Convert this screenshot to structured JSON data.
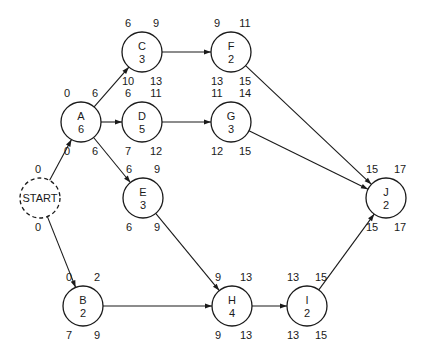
{
  "diagram": {
    "type": "PERT / activity-on-node network",
    "nodes": [
      {
        "id": "START",
        "name": "START",
        "duration": "",
        "x": 40,
        "y": 198,
        "dashed": true,
        "es": "0",
        "ef": "",
        "ls": "0",
        "lf": ""
      },
      {
        "id": "A",
        "name": "A",
        "duration": "6",
        "x": 81,
        "y": 122,
        "es": "0",
        "ef": "6",
        "ls": "0",
        "lf": "6"
      },
      {
        "id": "B",
        "name": "B",
        "duration": "2",
        "x": 83,
        "y": 306,
        "es": "0",
        "ef": "2",
        "ls": "7",
        "lf": "9"
      },
      {
        "id": "C",
        "name": "C",
        "duration": "3",
        "x": 142,
        "y": 52,
        "es": "6",
        "ef": "9",
        "ls": "10",
        "lf": "13"
      },
      {
        "id": "D",
        "name": "D",
        "duration": "5",
        "x": 142,
        "y": 122,
        "es": "6",
        "ef": "11",
        "ls": "7",
        "lf": "12"
      },
      {
        "id": "E",
        "name": "E",
        "duration": "3",
        "x": 143,
        "y": 198,
        "es": "6",
        "ef": "9",
        "ls": "6",
        "lf": "9"
      },
      {
        "id": "F",
        "name": "F",
        "duration": "2",
        "x": 231,
        "y": 52,
        "es": "9",
        "ef": "11",
        "ls": "13",
        "lf": "15"
      },
      {
        "id": "G",
        "name": "G",
        "duration": "3",
        "x": 231,
        "y": 122,
        "es": "11",
        "ef": "14",
        "ls": "12",
        "lf": "15"
      },
      {
        "id": "H",
        "name": "H",
        "duration": "4",
        "x": 232,
        "y": 306,
        "es": "9",
        "ef": "13",
        "ls": "9",
        "lf": "13"
      },
      {
        "id": "I",
        "name": "I",
        "duration": "2",
        "x": 307,
        "y": 306,
        "es": "13",
        "ef": "15",
        "ls": "13",
        "lf": "15"
      },
      {
        "id": "J",
        "name": "J",
        "duration": "2",
        "x": 386,
        "y": 198,
        "es": "15",
        "ef": "17",
        "ls": "15",
        "lf": "17"
      }
    ],
    "edges": [
      {
        "from": "START",
        "to": "A"
      },
      {
        "from": "START",
        "to": "B"
      },
      {
        "from": "A",
        "to": "C"
      },
      {
        "from": "A",
        "to": "D"
      },
      {
        "from": "A",
        "to": "E"
      },
      {
        "from": "C",
        "to": "F"
      },
      {
        "from": "D",
        "to": "G"
      },
      {
        "from": "E",
        "to": "H"
      },
      {
        "from": "B",
        "to": "H"
      },
      {
        "from": "H",
        "to": "I"
      },
      {
        "from": "F",
        "to": "J"
      },
      {
        "from": "G",
        "to": "J"
      },
      {
        "from": "I",
        "to": "J"
      }
    ],
    "radius": 20,
    "colors": {
      "stroke": "#1a1a1a",
      "fill": "#ffffff",
      "text": "#1a1a1a"
    }
  }
}
